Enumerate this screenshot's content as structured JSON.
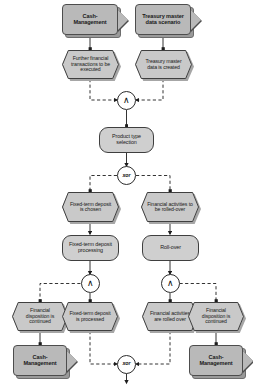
{
  "diagram": {
    "type": "epc",
    "colors": {
      "process_path_fill": "#b9b9b9",
      "process_path_shadow": "#9a9a9a",
      "event_fill": "#c9c9c9",
      "event_shadow": "#a6a6a6",
      "function_fill": "#cfcfcf",
      "connector_fill": "#ffffff",
      "outline": "#3f3f3f",
      "text": "#1a1a1a",
      "background": "#ffffff"
    },
    "nodes": {
      "path_cash_mgmt_top": {
        "label": "Cash-Management",
        "shape": "process-path"
      },
      "path_treasury_master": {
        "label": "Treasury master data scenario",
        "shape": "process-path"
      },
      "event_further_fin": {
        "label": "Further financial transactions to be executed",
        "shape": "event"
      },
      "event_treasury_created": {
        "label": "Treasury master data is created",
        "shape": "event"
      },
      "and_top": {
        "label": "∧",
        "shape": "connector",
        "operator": "AND"
      },
      "func_product_type": {
        "label": "Product type selection",
        "shape": "function"
      },
      "xor_mid": {
        "label": "xor",
        "shape": "connector",
        "operator": "XOR"
      },
      "event_fixed_chosen": {
        "label": "Fixed-term deposit is chosen",
        "shape": "event"
      },
      "event_roll_required": {
        "label": "Financial activities to be rolled-over",
        "shape": "event"
      },
      "func_fixed_processing": {
        "label": "Fixed-term deposit processing",
        "shape": "function"
      },
      "func_rollover": {
        "label": "Roll-over",
        "shape": "function"
      },
      "and_left": {
        "label": "∧",
        "shape": "connector",
        "operator": "AND"
      },
      "and_right": {
        "label": "∧",
        "shape": "connector",
        "operator": "AND"
      },
      "event_disp_cont_left": {
        "label": "Financial disposition is continued",
        "shape": "event"
      },
      "event_fixed_processed": {
        "label": "Fixed-term deposit is processed",
        "shape": "event"
      },
      "event_activities_rolled": {
        "label": "Financial activities are rolled over",
        "shape": "event"
      },
      "event_disp_cont_right": {
        "label": "Financial disposition is continued",
        "shape": "event"
      },
      "path_cash_mgmt_bottom_left": {
        "label": "Cash-Management",
        "shape": "process-path"
      },
      "xor_bottom": {
        "label": "xor",
        "shape": "connector",
        "operator": "XOR"
      },
      "path_cash_mgmt_bottom_right": {
        "label": "Cash-Management",
        "shape": "process-path"
      }
    }
  }
}
